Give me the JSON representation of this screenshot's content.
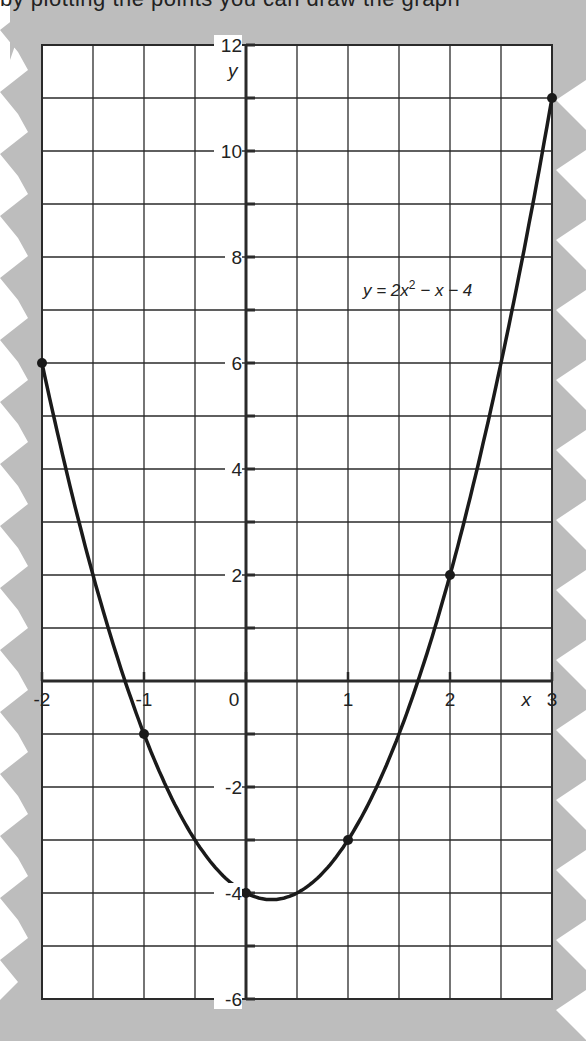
{
  "header": {
    "cut_text": "by plotting the points you can draw the graph"
  },
  "colors": {
    "paper_background": "#bdbdbd",
    "grid_background": "#ffffff",
    "grid_line": "#2a2a2a",
    "curve": "#1a1a1a",
    "text": "#222222"
  },
  "chart_data": {
    "type": "line",
    "title": "",
    "equation_label": "y = 2x² − x − 4",
    "equation_parts": {
      "lhs": "y = 2x",
      "sup": "2",
      "rhs": " − x − 4"
    },
    "xlabel": "x",
    "ylabel": "y",
    "xlim": [
      -2,
      3
    ],
    "ylim": [
      -6,
      12
    ],
    "grid": true,
    "x_grid_step": 0.5,
    "y_grid_step": 1,
    "x_ticks": [
      {
        "value": -2,
        "label": "-2"
      },
      {
        "value": -1,
        "label": "-1"
      },
      {
        "value": 0,
        "label": "0"
      },
      {
        "value": 1,
        "label": "1"
      },
      {
        "value": 2,
        "label": "2"
      },
      {
        "value": 3,
        "label": "3"
      }
    ],
    "y_ticks": [
      {
        "value": 12,
        "label": "12"
      },
      {
        "value": 10,
        "label": "10"
      },
      {
        "value": 8,
        "label": "8"
      },
      {
        "value": 6,
        "label": "6"
      },
      {
        "value": 4,
        "label": "4"
      },
      {
        "value": 2,
        "label": "2"
      },
      {
        "value": -2,
        "label": "-2"
      },
      {
        "value": -4,
        "label": "-4"
      },
      {
        "value": -6,
        "label": "-6"
      }
    ],
    "series": [
      {
        "name": "y = 2x² − x − 4",
        "x": [
          -2,
          -1,
          0,
          1,
          2,
          3
        ],
        "values": [
          6,
          -1,
          -4,
          -3,
          2,
          11
        ],
        "markers": true
      }
    ]
  }
}
